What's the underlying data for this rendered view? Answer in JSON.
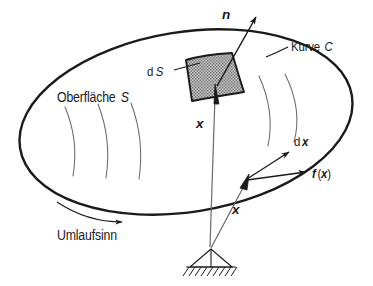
{
  "figure": {
    "title_semantic": "surface-and-curve-vector-diagram",
    "language": "de",
    "colors": {
      "ink": "#1a1a1a",
      "thin_ink": "#555555",
      "patch_fill": "#b9b9b9",
      "background": "#ffffff"
    },
    "labels": {
      "normal_vector": "n",
      "curve": "Kurve",
      "curve_symbol": "C",
      "surface_element": "d",
      "surface_element_symbol": "S",
      "surface": "Oberfläche",
      "surface_symbol": "S",
      "position_vector_upper": "x",
      "position_vector_lower": "x",
      "line_element_d": "d",
      "line_element_symbol": "x",
      "force_f": "f",
      "force_open_paren": "(",
      "force_arg": "x",
      "force_close_paren": ")",
      "orientation": "Umlaufsinn"
    },
    "geometry": {
      "ellipse": {
        "cx": 186,
        "cy": 122,
        "rx": 168,
        "ry": 90,
        "rotation_deg": -9
      },
      "patch_center": {
        "x": 210,
        "y": 78
      },
      "tangent_point": {
        "x": 249,
        "y": 178
      },
      "support_point": {
        "x": 211,
        "y": 249
      },
      "normal_tip": {
        "x": 259,
        "y": 13
      }
    }
  }
}
